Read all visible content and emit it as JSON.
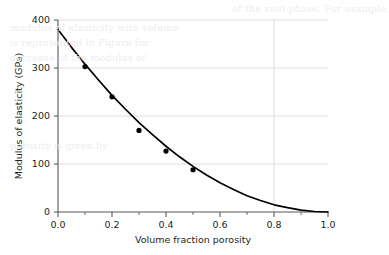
{
  "chart_data": {
    "type": "line",
    "title": "",
    "xlabel": "Volume fraction porosity",
    "ylabel": "Modulus of elasticity (GPa)",
    "xlim": [
      0.0,
      1.0
    ],
    "ylim": [
      0,
      400
    ],
    "xticks": [
      "0.0",
      "0.2",
      "0.4",
      "0.6",
      "0.8",
      "1.0"
    ],
    "xtick_values": [
      0.0,
      0.2,
      0.4,
      0.6,
      0.8,
      1.0
    ],
    "yticks": [
      "0",
      "100",
      "200",
      "300",
      "400"
    ],
    "ytick_values": [
      0,
      100,
      200,
      300,
      400
    ],
    "grid": true,
    "legend": null,
    "series": [
      {
        "name": "fitted curve",
        "type": "line",
        "color": "#000000",
        "x": [
          0.0,
          0.05,
          0.1,
          0.15,
          0.2,
          0.25,
          0.3,
          0.35,
          0.4,
          0.45,
          0.5,
          0.55,
          0.6,
          0.65,
          0.7,
          0.75,
          0.8,
          0.85,
          0.9,
          0.95,
          1.0
        ],
        "values": [
          380,
          343,
          308,
          275,
          243,
          214,
          186,
          161,
          137,
          115,
          95,
          77,
          61,
          47,
          34,
          24,
          15,
          9,
          4,
          1,
          0
        ]
      },
      {
        "name": "measured data",
        "type": "scatter",
        "color": "#000000",
        "x": [
          0.1,
          0.2,
          0.3,
          0.4,
          0.5
        ],
        "values": [
          303,
          240,
          170,
          127,
          88
        ]
      }
    ]
  },
  "background_text": {
    "lines": [
      "of the void phase. For example,",
      "modulus of elasticity with volume",
      "is represented in Figure for",
      "decrease of the modulus of",
      "porosity is given by"
    ]
  }
}
